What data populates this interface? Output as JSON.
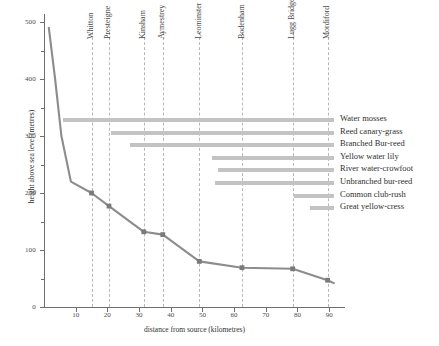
{
  "chart_data": {
    "type": "line",
    "title": "",
    "xlabel": "distance from source (kilometres)",
    "ylabel": "height above sea level (metres)",
    "xlim": [
      0,
      95
    ],
    "ylim": [
      0,
      500
    ],
    "grid": "vertical dashed gridlines at settlement positions",
    "legend": "right-side species range bars",
    "x_ticks": [
      10,
      20,
      30,
      40,
      50,
      60,
      70,
      80,
      90
    ],
    "y_ticks": [
      0,
      100,
      200,
      300,
      400,
      500
    ],
    "y_minor_ticks": [
      50,
      150,
      250,
      350,
      450
    ],
    "series": [
      {
        "name": "River Lugg long profile",
        "x": [
          1.5,
          3.5,
          5.5,
          8.5,
          15,
          20.5,
          31.5,
          37.5,
          49,
          62.5,
          78.5,
          89.5,
          91.5
        ],
        "values": [
          490,
          400,
          300,
          220,
          200,
          177,
          132,
          127,
          80,
          69,
          67,
          47,
          42
        ],
        "marker_x": [
          15,
          20.5,
          31.5,
          37.5,
          49,
          62.5,
          78.5,
          89.5
        ],
        "marker_values": [
          200,
          177,
          132,
          127,
          80,
          69,
          67,
          47
        ]
      }
    ],
    "settlements": [
      {
        "name": "Whitton",
        "km": 15
      },
      {
        "name": "Presteigne",
        "km": 20.5
      },
      {
        "name": "Kinsham",
        "km": 31.5
      },
      {
        "name": "Aymestrey",
        "km": 37.5
      },
      {
        "name": "Leominster",
        "km": 49
      },
      {
        "name": "Bodenham",
        "km": 62.5
      },
      {
        "name": "Lugg Bridge",
        "km": 78.5
      },
      {
        "name": "Mordiford",
        "km": 89.5
      }
    ],
    "species_ranges": [
      {
        "name": "Water mosses",
        "start_km": 6,
        "end_km": 91.5
      },
      {
        "name": "Reed canary-grass",
        "start_km": 21,
        "end_km": 91.5
      },
      {
        "name": "Branched Bur-reed",
        "start_km": 27,
        "end_km": 91.5
      },
      {
        "name": "Yellow water lily",
        "start_km": 53,
        "end_km": 91.5
      },
      {
        "name": "River water-crowfoot",
        "start_km": 55,
        "end_km": 91.5
      },
      {
        "name": "Unbranched bur-reed",
        "start_km": 54,
        "end_km": 91.5
      },
      {
        "name": "Common club-rush",
        "start_km": 79,
        "end_km": 91.5
      },
      {
        "name": "Great yellow-cress",
        "start_km": 84,
        "end_km": 91.5
      }
    ],
    "colors": {
      "line": "#8c8c8c",
      "marker": "#7a7a7a",
      "bar": "#c3c3c3",
      "axis": "#6e6e6e",
      "gridline": "#b9b9b9",
      "text": "#2f2f2f"
    }
  }
}
